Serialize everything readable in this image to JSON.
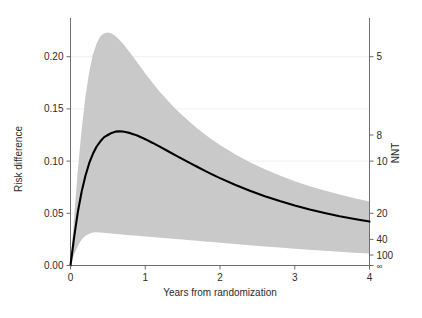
{
  "chart_data": {
    "type": "line",
    "title": "",
    "subtitle": "",
    "xlabel": "Years from randomization",
    "ylabel": "Risk difference",
    "y2label": "NNT",
    "xlim": [
      0,
      4
    ],
    "ylim": [
      0.0,
      0.2275
    ],
    "grid": true,
    "legend": null,
    "x_ticks": [
      "0",
      "1",
      "2",
      "3",
      "4"
    ],
    "x_tick_values": [
      0,
      1,
      2,
      3,
      4
    ],
    "y_ticks": [
      "0.00",
      "0.05",
      "0.10",
      "0.15",
      "0.20"
    ],
    "y_tick_values": [
      0.0,
      0.05,
      0.1,
      0.15,
      0.2
    ],
    "y2_ticks": [
      "5",
      "8",
      "10",
      "20",
      "40",
      "100",
      "∞"
    ],
    "y2_tick_values": [
      0.2,
      0.125,
      0.1,
      0.05,
      0.025,
      0.01,
      0.0
    ],
    "series": [
      {
        "name": "Risk difference estimate",
        "style": "solid-line",
        "color": "#000000",
        "x": [
          0,
          0.05,
          0.1,
          0.15,
          0.2,
          0.25,
          0.3,
          0.35,
          0.4,
          0.45,
          0.5,
          0.55,
          0.6,
          0.65,
          0.7,
          0.75,
          0.8,
          0.85,
          0.9,
          0.95,
          1.0,
          1.1,
          1.2,
          1.3,
          1.4,
          1.5,
          1.6,
          1.7,
          1.8,
          1.9,
          2.0,
          2.2,
          2.4,
          2.6,
          2.8,
          3.0,
          3.2,
          3.4,
          3.6,
          3.8,
          4.0
        ],
        "y": [
          0.0,
          0.028,
          0.052,
          0.071,
          0.086,
          0.098,
          0.107,
          0.114,
          0.119,
          0.123,
          0.125,
          0.127,
          0.1282,
          0.1285,
          0.1283,
          0.1277,
          0.1268,
          0.1256,
          0.1242,
          0.1227,
          0.121,
          0.1174,
          0.1136,
          0.1097,
          0.1058,
          0.1019,
          0.098,
          0.0943,
          0.0906,
          0.0871,
          0.0837,
          0.0774,
          0.0716,
          0.0664,
          0.0617,
          0.0575,
          0.0537,
          0.0503,
          0.0472,
          0.0445,
          0.0421
        ]
      }
    ],
    "band": {
      "name": "95% confidence interval",
      "color": "#c9c9c9",
      "x": [
        0,
        0.05,
        0.1,
        0.15,
        0.2,
        0.25,
        0.3,
        0.35,
        0.4,
        0.45,
        0.5,
        0.55,
        0.6,
        0.65,
        0.7,
        0.75,
        0.8,
        0.85,
        0.9,
        0.95,
        1.0,
        1.1,
        1.2,
        1.3,
        1.4,
        1.5,
        1.6,
        1.7,
        1.8,
        1.9,
        2.0,
        2.2,
        2.4,
        2.6,
        2.8,
        3.0,
        3.2,
        3.4,
        3.6,
        3.8,
        4.0
      ],
      "upper": [
        0.0,
        0.048,
        0.093,
        0.131,
        0.162,
        0.185,
        0.202,
        0.213,
        0.2195,
        0.2225,
        0.2232,
        0.2222,
        0.2198,
        0.2165,
        0.2126,
        0.2082,
        0.2035,
        0.1987,
        0.1938,
        0.1889,
        0.184,
        0.1747,
        0.166,
        0.158,
        0.1505,
        0.1436,
        0.1371,
        0.1311,
        0.1255,
        0.1203,
        0.1154,
        0.1066,
        0.0989,
        0.0921,
        0.0861,
        0.0808,
        0.076,
        0.0718,
        0.0679,
        0.0645,
        0.0614
      ],
      "lower": [
        0.0,
        0.011,
        0.019,
        0.025,
        0.0285,
        0.0305,
        0.0315,
        0.0318,
        0.0317,
        0.0314,
        0.031,
        0.0306,
        0.0302,
        0.0299,
        0.0296,
        0.0293,
        0.029,
        0.0287,
        0.0284,
        0.0281,
        0.0278,
        0.0272,
        0.0266,
        0.026,
        0.0254,
        0.0248,
        0.0242,
        0.0236,
        0.023,
        0.0224,
        0.0218,
        0.0206,
        0.0194,
        0.0183,
        0.0172,
        0.0161,
        0.0151,
        0.0141,
        0.0132,
        0.0123,
        0.0114
      ]
    },
    "annotations": []
  }
}
